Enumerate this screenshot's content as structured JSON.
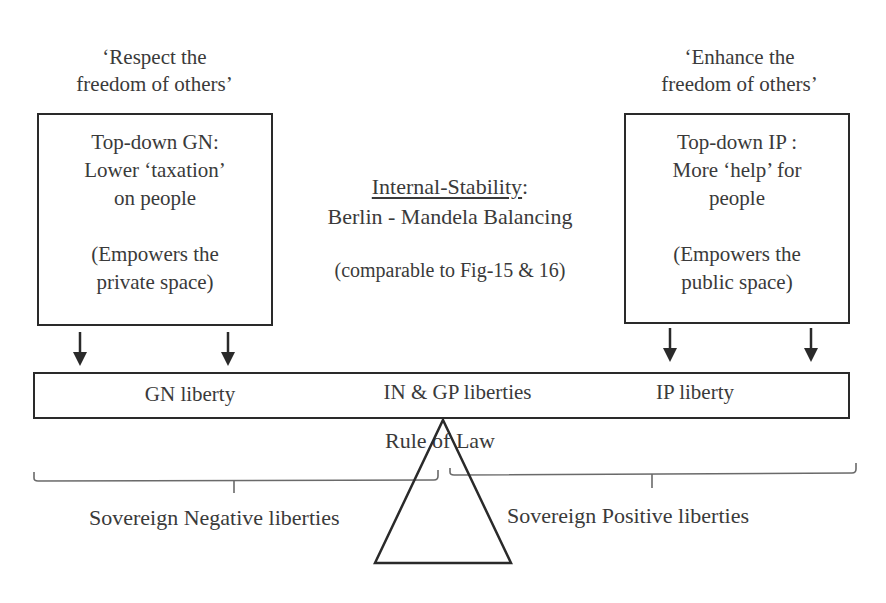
{
  "diagram": {
    "left": {
      "quote_line1": "‘Respect the",
      "quote_line2": "freedom of others’",
      "box_lines": [
        "Top-down GN:",
        "Lower ‘taxation’",
        "on people"
      ],
      "box_note_lines": [
        "(Empowers the",
        "private space)"
      ]
    },
    "right": {
      "quote_line1": "‘Enhance the",
      "quote_line2": "freedom of others’",
      "box_lines": [
        "Top-down IP :",
        "More ‘help’ for",
        "people"
      ],
      "box_note_lines": [
        "(Empowers the",
        "public space)"
      ]
    },
    "center": {
      "title": "Internal-Stability",
      "title_suffix": ":",
      "subtitle": "Berlin - Mandela Balancing",
      "note": "(comparable to Fig-15 & 16)"
    },
    "beam": {
      "labels": [
        "GN liberty",
        "IN & GP liberties",
        "IP liberty"
      ]
    },
    "fulcrum_label": "Rule of Law",
    "braces": {
      "left_label": "Sovereign Negative liberties",
      "right_label": "Sovereign Positive liberties"
    },
    "colors": {
      "line": "#2a2a2a",
      "text": "#3a3a3a",
      "brace": "#6a6a6a",
      "background": "#ffffff"
    }
  }
}
